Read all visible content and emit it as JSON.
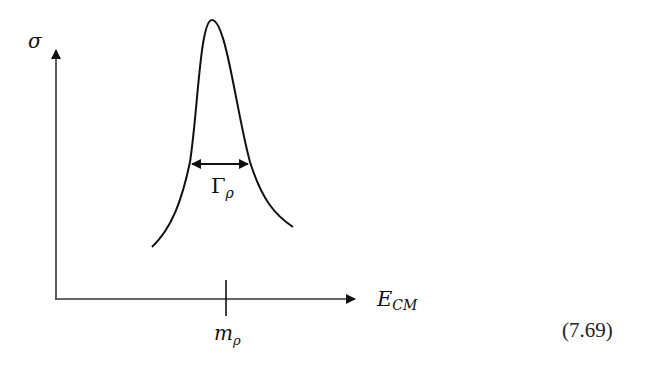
{
  "figure": {
    "type": "resonance-peak-sketch",
    "y_axis_label": "σ",
    "x_axis_label_main": "E",
    "x_axis_label_sub": "CM",
    "width_label_main": "Γ",
    "width_label_sub": "ρ",
    "tick_label_main": "m",
    "tick_label_sub": "ρ",
    "equation_number": "(7.69)",
    "line_color": "#111111"
  }
}
